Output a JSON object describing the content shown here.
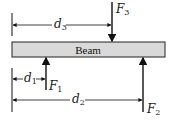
{
  "diagram": {
    "beam": {
      "label": "Beam",
      "fill": "#d9d9d9",
      "stroke": "#222222"
    },
    "forces": [
      {
        "name": "F",
        "sub": "1",
        "direction": "up"
      },
      {
        "name": "F",
        "sub": "2",
        "direction": "up"
      },
      {
        "name": "F",
        "sub": "3",
        "direction": "down"
      }
    ],
    "dimensions": [
      {
        "name": "d",
        "sub": "1"
      },
      {
        "name": "d",
        "sub": "2"
      },
      {
        "name": "d",
        "sub": "3"
      }
    ]
  }
}
